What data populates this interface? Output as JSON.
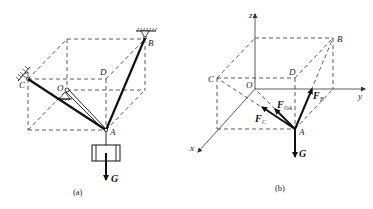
{
  "figure_a": {
    "caption": "(a)",
    "points": {
      "B": "B",
      "C": "C",
      "D": "D",
      "O": "O",
      "A": "A"
    },
    "load_label": "G"
  },
  "figure_b": {
    "caption": "(b)",
    "axes": {
      "x": "x",
      "y": "y",
      "z": "z"
    },
    "points": {
      "B": "B",
      "C": "C",
      "D": "D",
      "O": "O",
      "A": "A"
    },
    "forces": {
      "F_OA": {
        "main": "F",
        "sub": "OA"
      },
      "F_C": {
        "main": "F",
        "sub": "C"
      },
      "F_B": {
        "main": "F",
        "sub": "B"
      },
      "G": "G"
    }
  }
}
